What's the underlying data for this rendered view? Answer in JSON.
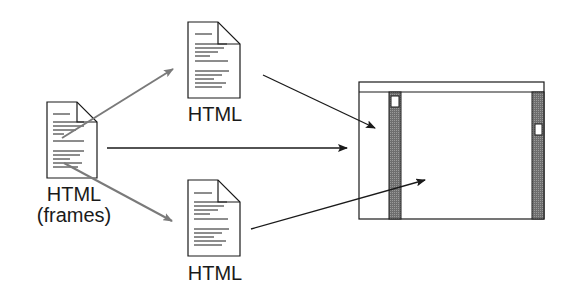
{
  "diagram": {
    "title": "",
    "nodes": [
      {
        "id": "frameset",
        "label": "HTML",
        "sublabel": "(frames)"
      },
      {
        "id": "top_doc",
        "label": "HTML"
      },
      {
        "id": "bottom_doc",
        "label": "HTML"
      },
      {
        "id": "browser_window",
        "label": ""
      }
    ],
    "edges": [
      {
        "from": "frameset",
        "to": "top_doc",
        "style": "gray"
      },
      {
        "from": "frameset",
        "to": "bottom_doc",
        "style": "gray"
      },
      {
        "from": "frameset",
        "to": "browser_window",
        "style": "black"
      },
      {
        "from": "top_doc",
        "to": "browser_window.left_frame",
        "style": "black"
      },
      {
        "from": "bottom_doc",
        "to": "browser_window.right_frame",
        "style": "black"
      }
    ],
    "colors": {
      "ink": "#1a1a1a",
      "gray_arrow": "#7a7a7a",
      "scrollbar": "#808080"
    }
  }
}
